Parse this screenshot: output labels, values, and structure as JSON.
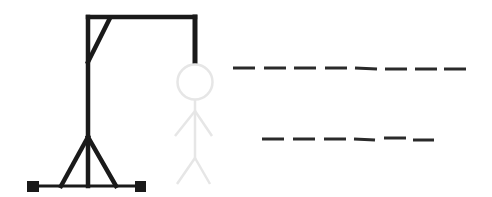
{
  "game": {
    "name": "hangman",
    "colors": {
      "gallows": "#1a1a1a",
      "figure": "#e6e6e6",
      "blanks": "#2a2a2a",
      "background": "#ffffff"
    },
    "words": [
      {
        "letters": 8,
        "revealed": [
          "",
          "",
          "",
          "",
          "",
          "",
          "",
          ""
        ]
      },
      {
        "letters": 6,
        "revealed": [
          "",
          "",
          "",
          "",
          "",
          ""
        ]
      }
    ],
    "figure_parts": [
      "head",
      "body",
      "left-arm",
      "right-arm",
      "left-leg",
      "right-leg"
    ]
  }
}
